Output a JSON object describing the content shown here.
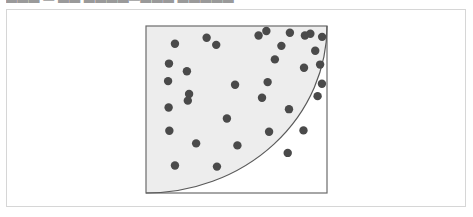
{
  "top_caption": {
    "text": "▬▬▬ — ▬▬ ▬▬▬▬—▬▬▬ ▬▬▬▬▬",
    "note": "line of text clipped by the top edge of the screenshot; glyphs not legible"
  },
  "panel": {
    "border_color": "#d6d6d6",
    "background_color": "#ffffff"
  },
  "figure": {
    "name": "quarter-circle-in-square-scatter",
    "square": {
      "stroke_color": "#6b6b6b",
      "stroke_width": 1.2,
      "fill_color": "#ffffff"
    },
    "arc": {
      "shape": "quarter-circle",
      "center": "top-left",
      "radius_fraction_of_side": 1.0,
      "stroke_color": "#5a5a5a",
      "stroke_width": 1.2,
      "region_fill_color": "#ededed",
      "region_label": "inside-arc"
    },
    "points": {
      "marker_color": "#4a4a4a",
      "marker_radius_px": 4.2,
      "count_total": 35,
      "count_inside": 23,
      "count_outside": 12,
      "inside": [
        [
          0.16,
          0.106
        ],
        [
          0.335,
          0.07
        ],
        [
          0.127,
          0.225
        ],
        [
          0.226,
          0.271
        ],
        [
          0.388,
          0.113
        ],
        [
          0.238,
          0.407
        ],
        [
          0.122,
          0.33
        ],
        [
          0.125,
          0.488
        ],
        [
          0.231,
          0.447
        ],
        [
          0.492,
          0.352
        ],
        [
          0.672,
          0.336
        ],
        [
          0.641,
          0.43
        ],
        [
          0.712,
          0.2
        ],
        [
          0.129,
          0.627
        ],
        [
          0.447,
          0.554
        ],
        [
          0.277,
          0.703
        ],
        [
          0.68,
          0.633
        ],
        [
          0.79,
          0.498
        ],
        [
          0.505,
          0.715
        ],
        [
          0.16,
          0.835
        ],
        [
          0.392,
          0.842
        ],
        [
          0.783,
          0.76
        ],
        [
          0.87,
          0.625
        ]
      ],
      "outside": [
        [
          0.622,
          0.057
        ],
        [
          0.748,
          0.119
        ],
        [
          0.908,
          0.046
        ],
        [
          0.935,
          0.148
        ],
        [
          0.873,
          0.25
        ],
        [
          0.973,
          0.065
        ],
        [
          0.962,
          0.231
        ],
        [
          0.878,
          0.057
        ],
        [
          0.795,
          0.04
        ],
        [
          0.972,
          0.346
        ],
        [
          0.665,
          0.03
        ],
        [
          0.948,
          0.42
        ]
      ]
    }
  }
}
